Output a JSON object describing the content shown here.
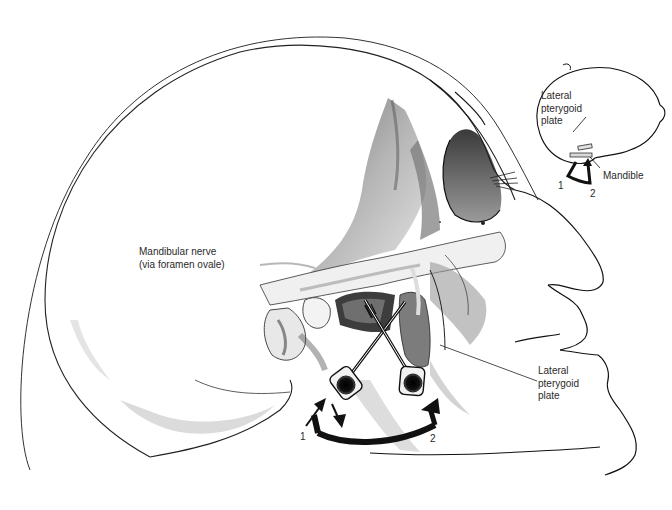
{
  "figure": {
    "colors": {
      "background": "#ffffff",
      "ink": "#1a1a1a",
      "bone_shade_dark": "#4a4a4a",
      "bone_shade_mid": "#8c8c8c",
      "bone_shade_light": "#d4d4d4",
      "arrow": "#111111"
    }
  },
  "labels": {
    "mandibular_nerve": {
      "line1": "Mandibular nerve",
      "line2": "(via foramen ovale)"
    },
    "lateral_pterygoid_plate_main": {
      "line1": "Lateral",
      "line2": "pterygoid",
      "line3": "plate"
    },
    "inset_lateral_pterygoid_plate": {
      "line1": "Lateral",
      "line2": "pterygoid",
      "line3": "plate"
    },
    "inset_mandible": "Mandible"
  },
  "main_arrows": {
    "position_1": "1",
    "position_2": "2"
  },
  "inset_arrows": {
    "position_1": "1",
    "position_2": "2"
  },
  "icons": {
    "needle_1": "needle-icon",
    "needle_2": "needle-icon",
    "redirect_arrow": "curved-arrow-icon",
    "in_arrow": "arrow-up-icon",
    "out_arrow": "arrow-down-icon"
  }
}
